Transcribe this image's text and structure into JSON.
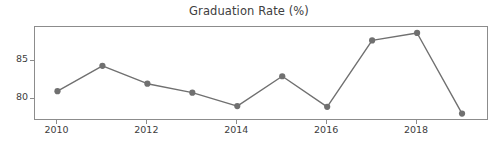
{
  "chart_data": {
    "type": "line",
    "title": "Graduation Rate (%)",
    "xlabel": "",
    "ylabel": "",
    "x": [
      2010,
      2011,
      2012,
      2013,
      2014,
      2015,
      2016,
      2017,
      2018,
      2019
    ],
    "values": [
      81.0,
      84.4,
      82.0,
      80.8,
      79.0,
      83.0,
      78.9,
      87.8,
      88.8,
      78.0
    ],
    "series": [
      {
        "name": "Graduation Rate",
        "values": [
          81.0,
          84.4,
          82.0,
          80.8,
          79.0,
          83.0,
          78.9,
          87.8,
          88.8,
          78.0
        ]
      }
    ],
    "xlim": [
      2009.5,
      2019.6
    ],
    "ylim": [
      77.0,
      89.6
    ],
    "xticks": [
      2010,
      2012,
      2014,
      2016,
      2018
    ],
    "xtick_labels": [
      "2010",
      "2012",
      "2014",
      "2016",
      "2018"
    ],
    "yticks": [
      80,
      85
    ],
    "ytick_labels": [
      "80",
      "85"
    ],
    "grid": false,
    "legend": false,
    "line_color": "#707070",
    "marker": "circle",
    "marker_color": "#707070",
    "axes_color": "#8c8c8c",
    "background": "#ffffff",
    "text_color": "#3d3d3d"
  }
}
